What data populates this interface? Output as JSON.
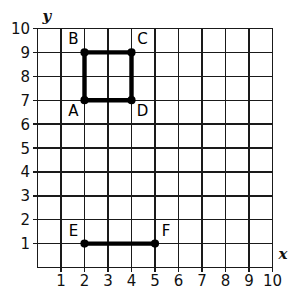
{
  "figure": {
    "background_color": "#ffffff",
    "grid_color": "#1a1a1a",
    "shape_color": "#000000"
  },
  "axes": {
    "x_axis_label": "x",
    "y_axis_label": "y",
    "x_ticks": [
      "1",
      "2",
      "3",
      "4",
      "5",
      "6",
      "7",
      "8",
      "9",
      "10"
    ],
    "y_ticks": [
      "1",
      "2",
      "3",
      "4",
      "5",
      "6",
      "7",
      "8",
      "9",
      "10"
    ],
    "x_range": [
      0,
      10
    ],
    "y_range": [
      0,
      10
    ],
    "grid": true
  },
  "chart_data": {
    "type": "scatter",
    "xlabel": "x",
    "ylabel": "y",
    "xlim": [
      0,
      10
    ],
    "ylim": [
      0,
      10
    ],
    "grid": true,
    "legend": "none",
    "points": [
      {
        "label": "A",
        "x": 2,
        "y": 7,
        "label_pos": "below-left"
      },
      {
        "label": "B",
        "x": 2,
        "y": 9,
        "label_pos": "above-left"
      },
      {
        "label": "C",
        "x": 4,
        "y": 9,
        "label_pos": "above-right"
      },
      {
        "label": "D",
        "x": 4,
        "y": 7,
        "label_pos": "below-right"
      },
      {
        "label": "E",
        "x": 2,
        "y": 1,
        "label_pos": "above-left"
      },
      {
        "label": "F",
        "x": 5,
        "y": 1,
        "label_pos": "above-right"
      }
    ],
    "shapes": [
      {
        "name": "square-ABCD",
        "kind": "polygon",
        "vertices": [
          "A",
          "B",
          "C",
          "D"
        ],
        "coordinates": [
          [
            2,
            7
          ],
          [
            2,
            9
          ],
          [
            4,
            9
          ],
          [
            4,
            7
          ]
        ],
        "closed": true
      },
      {
        "name": "segment-EF",
        "kind": "segment",
        "vertices": [
          "E",
          "F"
        ],
        "coordinates": [
          [
            2,
            1
          ],
          [
            5,
            1
          ]
        ],
        "closed": false
      }
    ]
  }
}
